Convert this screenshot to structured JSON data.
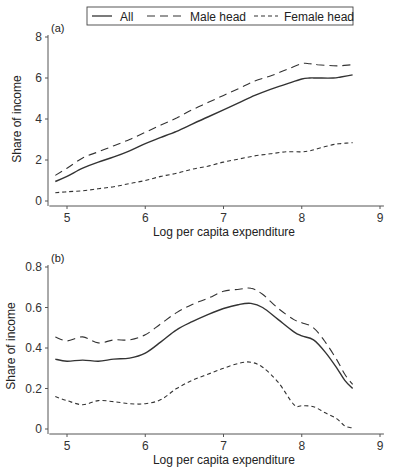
{
  "legend": {
    "items": [
      {
        "label": "All",
        "style": "solid"
      },
      {
        "label": "Male head",
        "style": "longdash"
      },
      {
        "label": "Female head",
        "style": "shortdash"
      }
    ]
  },
  "colors": {
    "line": "#333333",
    "axis": "#555555",
    "text": "#222222",
    "background": "#ffffff"
  },
  "chart_data": [
    {
      "panel": "(a)",
      "type": "line",
      "title": "",
      "xlabel": "Log per capita expenditure",
      "ylabel": "Share of income",
      "xlim": [
        4.8,
        9.05
      ],
      "ylim": [
        0,
        8
      ],
      "xticks": [
        5,
        6,
        7,
        8,
        9
      ],
      "yticks": [
        0,
        2,
        4,
        6,
        8
      ],
      "ytick_labels": [
        "0",
        "2",
        "4",
        "6",
        "8"
      ],
      "grid": false,
      "legend_position": "top",
      "x": [
        4.85,
        5.0,
        5.2,
        5.4,
        5.6,
        5.8,
        6.0,
        6.2,
        6.4,
        6.6,
        6.8,
        7.0,
        7.2,
        7.4,
        7.6,
        7.8,
        8.0,
        8.1,
        8.2,
        8.4,
        8.5,
        8.65
      ],
      "series": [
        {
          "name": "All",
          "style": "solid",
          "values": [
            0.95,
            1.2,
            1.6,
            1.9,
            2.15,
            2.45,
            2.8,
            3.1,
            3.4,
            3.75,
            4.1,
            4.45,
            4.8,
            5.15,
            5.45,
            5.7,
            5.95,
            6.0,
            6.0,
            6.0,
            6.05,
            6.15
          ]
        },
        {
          "name": "Male head",
          "style": "longdash",
          "values": [
            1.25,
            1.6,
            2.1,
            2.4,
            2.7,
            3.0,
            3.35,
            3.7,
            4.05,
            4.45,
            4.8,
            5.15,
            5.5,
            5.85,
            6.1,
            6.4,
            6.7,
            6.7,
            6.65,
            6.6,
            6.6,
            6.65
          ]
        },
        {
          "name": "Female head",
          "style": "shortdash",
          "values": [
            0.4,
            0.45,
            0.5,
            0.6,
            0.7,
            0.85,
            1.0,
            1.2,
            1.35,
            1.55,
            1.7,
            1.9,
            2.05,
            2.2,
            2.3,
            2.4,
            2.4,
            2.45,
            2.55,
            2.75,
            2.8,
            2.85
          ]
        }
      ]
    },
    {
      "panel": "(b)",
      "type": "line",
      "title": "",
      "xlabel": "Log per capita expenditure",
      "ylabel": "Share of income",
      "xlim": [
        4.8,
        9.05
      ],
      "ylim": [
        0,
        0.8
      ],
      "xticks": [
        5,
        6,
        7,
        8,
        9
      ],
      "yticks": [
        0,
        0.2,
        0.4,
        0.6,
        0.8
      ],
      "ytick_labels": [
        "0",
        "0.2",
        "0.4",
        "0.6",
        "0.8"
      ],
      "grid": false,
      "x": [
        4.85,
        5.0,
        5.2,
        5.4,
        5.6,
        5.8,
        6.0,
        6.2,
        6.4,
        6.6,
        6.8,
        7.0,
        7.2,
        7.35,
        7.5,
        7.7,
        7.9,
        8.0,
        8.15,
        8.3,
        8.45,
        8.55,
        8.65
      ],
      "series": [
        {
          "name": "All",
          "style": "solid",
          "values": [
            0.345,
            0.335,
            0.34,
            0.335,
            0.345,
            0.35,
            0.375,
            0.43,
            0.49,
            0.53,
            0.565,
            0.595,
            0.615,
            0.62,
            0.6,
            0.54,
            0.48,
            0.46,
            0.44,
            0.38,
            0.3,
            0.24,
            0.2
          ]
        },
        {
          "name": "Male head",
          "style": "longdash",
          "values": [
            0.455,
            0.435,
            0.455,
            0.425,
            0.44,
            0.44,
            0.465,
            0.52,
            0.575,
            0.615,
            0.645,
            0.68,
            0.69,
            0.695,
            0.665,
            0.595,
            0.54,
            0.525,
            0.5,
            0.43,
            0.34,
            0.27,
            0.22
          ]
        },
        {
          "name": "Female head",
          "style": "shortdash",
          "values": [
            0.16,
            0.14,
            0.12,
            0.14,
            0.135,
            0.125,
            0.125,
            0.145,
            0.2,
            0.24,
            0.27,
            0.3,
            0.325,
            0.33,
            0.305,
            0.23,
            0.12,
            0.115,
            0.11,
            0.08,
            0.05,
            0.015,
            0.005
          ]
        }
      ]
    }
  ]
}
